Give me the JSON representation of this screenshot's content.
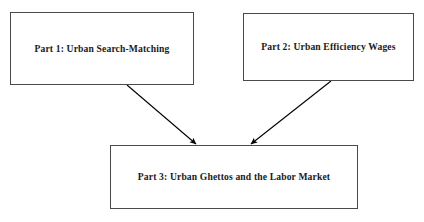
{
  "diagram": {
    "title": "",
    "background_color": "#ffffff",
    "border_color": "#4a4a4a",
    "text_color": "#1a1a1a",
    "arrow_color": "#000000",
    "nodes": [
      {
        "id": "part1",
        "label": "Part 1: Urban Search-Matching",
        "x": 10,
        "y": 12,
        "width": 184,
        "height": 73
      },
      {
        "id": "part2",
        "label": "Part 2: Urban Efficiency Wages",
        "x": 243,
        "y": 13,
        "width": 171,
        "height": 68
      },
      {
        "id": "part3",
        "label": "Part 3: Urban Ghettos and the Labor Market",
        "x": 110,
        "y": 145,
        "width": 248,
        "height": 64
      }
    ],
    "edges": [
      {
        "id": "edge-part1-to-part3",
        "from": "part1",
        "to": "part3",
        "label": "",
        "x1": 127,
        "y1": 85,
        "x2": 196,
        "y2": 144
      },
      {
        "id": "edge-part2-to-part3",
        "from": "part2",
        "to": "part3",
        "label": "",
        "x1": 331,
        "y1": 81,
        "x2": 251,
        "y2": 144
      }
    ]
  }
}
